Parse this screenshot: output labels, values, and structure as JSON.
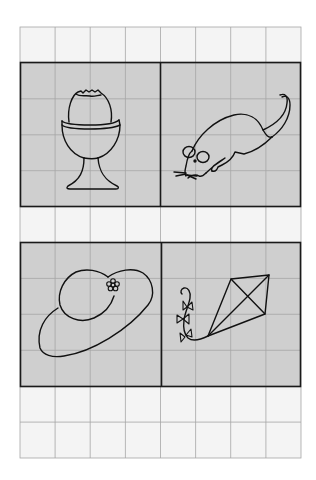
{
  "worksheet": {
    "grid": {
      "columns": 8,
      "rows": 12,
      "x0": 20,
      "y0": 27,
      "x1": 301,
      "y1": 458,
      "line_color": "#a6a6a6",
      "cell_fill": "#f4f4f4"
    },
    "panel_style": {
      "fill": "#cfcfcf",
      "border_color": "#1a1a1a"
    },
    "panels": [
      {
        "id": "egg-cup",
        "subject": "Boiled egg in egg cup",
        "row_span": [
          1,
          5
        ],
        "col_span": [
          0,
          4
        ]
      },
      {
        "id": "mouse",
        "subject": "Mouse",
        "row_span": [
          1,
          5
        ],
        "col_span": [
          4,
          8
        ]
      },
      {
        "id": "hat",
        "subject": "Sun hat with flower",
        "row_span": [
          6,
          10
        ],
        "col_span": [
          0,
          4
        ]
      },
      {
        "id": "kite",
        "subject": "Kite with bow tail",
        "row_span": [
          6,
          10
        ],
        "col_span": [
          4,
          8
        ]
      }
    ]
  }
}
